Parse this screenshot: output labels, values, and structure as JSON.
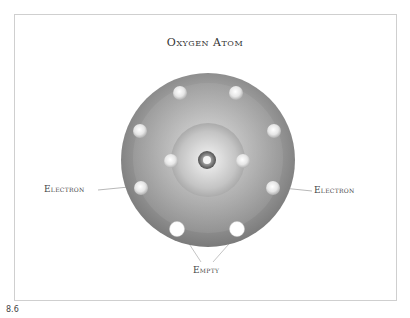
{
  "title": "Oxygen Atom",
  "figure_number": "8.6",
  "labels": {
    "electron_left": "Electron",
    "electron_right": "Electron",
    "empty": "Empty"
  },
  "atom": {
    "element": "Oxygen",
    "inner_shell_electrons": 2,
    "outer_shell_electrons": 6,
    "outer_shell_empty_slots": 2
  },
  "colors": {
    "shell_gray": "#8a8a8a",
    "frame_border": "#cfcfcf",
    "text": "#444444"
  }
}
